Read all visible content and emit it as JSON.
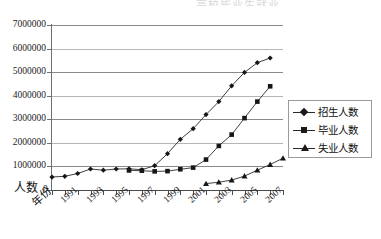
{
  "title_sliver": "高校毕业生就业",
  "chart_data": {
    "type": "line",
    "title": "",
    "xlabel": "年份",
    "ylabel": "人数",
    "ylim": [
      0,
      7000000
    ],
    "ytick_labels": [
      "7000000",
      "6000000",
      "5000000",
      "4000000",
      "3000000",
      "2000000",
      "1000000",
      "0"
    ],
    "ytick_values": [
      7000000,
      6000000,
      5000000,
      4000000,
      3000000,
      2000000,
      1000000,
      0
    ],
    "grid": true,
    "legend_position": "right",
    "x": [
      1990,
      1991,
      1992,
      1993,
      1994,
      1995,
      1996,
      1997,
      1998,
      1999,
      2000,
      2001,
      2002,
      2003,
      2004,
      2005,
      2006,
      2007,
      2008
    ],
    "xtick_labels": [
      "1991",
      "1993",
      "1995",
      "1997",
      "1999",
      "2001",
      "2003",
      "2005",
      "2007"
    ],
    "xtick_label_years": [
      1991,
      1993,
      1995,
      1997,
      1999,
      2001,
      2003,
      2005,
      2007
    ],
    "series": [
      {
        "name": "招生人数",
        "marker": "diamond",
        "values": [
          550000,
          580000,
          700000,
          890000,
          840000,
          890000,
          900000,
          860000,
          1030000,
          1540000,
          2150000,
          2600000,
          3200000,
          3750000,
          4420000,
          4990000,
          5400000,
          5600000,
          null
        ]
      },
      {
        "name": "毕业人数",
        "marker": "square",
        "values": [
          null,
          null,
          null,
          null,
          null,
          null,
          830000,
          820000,
          790000,
          800000,
          880000,
          950000,
          1290000,
          1870000,
          2350000,
          3050000,
          3750000,
          4400000,
          null
        ]
      },
      {
        "name": "失业人数",
        "marker": "triangle",
        "values": [
          null,
          null,
          null,
          null,
          null,
          null,
          null,
          null,
          null,
          null,
          null,
          null,
          270000,
          330000,
          420000,
          590000,
          840000,
          1080000,
          1350000
        ]
      }
    ]
  },
  "legend": {
    "items": [
      {
        "label": "招生人数",
        "marker": "diamond"
      },
      {
        "label": "毕业人数",
        "marker": "square"
      },
      {
        "label": "失业人数",
        "marker": "triangle"
      }
    ]
  }
}
